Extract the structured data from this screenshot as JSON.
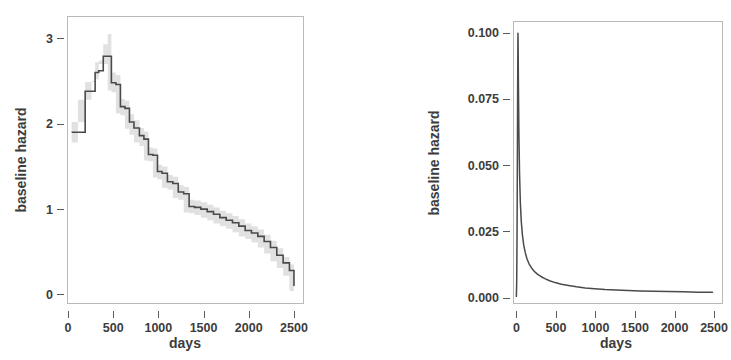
{
  "figure": {
    "background": "#ffffff",
    "line_color": "#4a4a4a",
    "band_color": "#cfcfcf",
    "frame_color": "#b9b9b9",
    "panel_count": 2
  },
  "chart_data": [
    {
      "id": "left-panel",
      "type": "line",
      "subtype": "step",
      "title": "",
      "xlabel": "days",
      "ylabel": "baseline hazard",
      "xlim": [
        0,
        2600
      ],
      "ylim": [
        -0.1,
        3.25
      ],
      "xticks": [
        0,
        500,
        1000,
        1500,
        2000,
        2500
      ],
      "xticklabels": [
        "0",
        "500",
        "1000",
        "1500",
        "2000",
        "2500"
      ],
      "yticks": [
        0,
        1,
        2,
        3
      ],
      "yticklabels": [
        "0",
        "1",
        "2",
        "3"
      ],
      "grid": false,
      "legend": "none",
      "has_confidence_band": true,
      "series": [
        {
          "name": "baseline hazard (step estimate)",
          "x": [
            40,
            110,
            190,
            260,
            300,
            340,
            390,
            440,
            480,
            530,
            580,
            630,
            680,
            730,
            790,
            840,
            890,
            940,
            990,
            1040,
            1100,
            1160,
            1220,
            1280,
            1340,
            1400,
            1470,
            1540,
            1610,
            1680,
            1750,
            1820,
            1890,
            1960,
            2030,
            2100,
            2170,
            2240,
            2310,
            2380,
            2450,
            2500
          ],
          "values": [
            1.9,
            1.9,
            2.38,
            2.38,
            2.6,
            2.62,
            2.79,
            2.79,
            2.48,
            2.46,
            2.2,
            2.18,
            2.02,
            1.95,
            1.86,
            1.82,
            1.64,
            1.63,
            1.44,
            1.42,
            1.32,
            1.3,
            1.2,
            1.18,
            1.03,
            1.02,
            1.0,
            0.97,
            0.94,
            0.9,
            0.87,
            0.84,
            0.8,
            0.75,
            0.72,
            0.68,
            0.62,
            0.55,
            0.46,
            0.37,
            0.28,
            0.1
          ],
          "band_lower": [
            1.78,
            1.78,
            2.28,
            2.28,
            2.5,
            2.52,
            2.7,
            2.7,
            2.39,
            2.37,
            2.12,
            2.1,
            1.94,
            1.87,
            1.78,
            1.74,
            1.57,
            1.56,
            1.37,
            1.35,
            1.25,
            1.23,
            1.13,
            1.11,
            0.96,
            0.95,
            0.93,
            0.9,
            0.87,
            0.83,
            0.8,
            0.77,
            0.73,
            0.68,
            0.65,
            0.61,
            0.55,
            0.48,
            0.39,
            0.31,
            0.22,
            0.04
          ],
          "band_upper": [
            2.02,
            2.02,
            2.49,
            2.49,
            2.72,
            2.74,
            2.93,
            3.05,
            2.6,
            2.57,
            2.29,
            2.27,
            2.11,
            2.04,
            1.95,
            1.91,
            1.72,
            1.71,
            1.52,
            1.5,
            1.4,
            1.38,
            1.28,
            1.26,
            1.11,
            1.1,
            1.08,
            1.05,
            1.02,
            0.98,
            0.95,
            0.92,
            0.88,
            0.83,
            0.8,
            0.76,
            0.7,
            0.63,
            0.54,
            0.44,
            0.35,
            0.17
          ]
        }
      ]
    },
    {
      "id": "right-panel",
      "type": "line",
      "subtype": "smooth",
      "title": "",
      "xlabel": "days",
      "ylabel": "baseline hazard",
      "xlim": [
        -30,
        2600
      ],
      "ylim": [
        -0.002,
        0.104
      ],
      "xticks": [
        0,
        500,
        1000,
        1500,
        2000,
        2500
      ],
      "xticklabels": [
        "0",
        "500",
        "1000",
        "1500",
        "2000",
        "2500"
      ],
      "yticks": [
        0.0,
        0.025,
        0.05,
        0.075,
        0.1
      ],
      "yticklabels": [
        "0.000",
        "0.025",
        "0.050",
        "0.075",
        "0.100"
      ],
      "grid": false,
      "legend": "none",
      "has_confidence_band": false,
      "series": [
        {
          "name": "baseline hazard (parametric)",
          "x": [
            0,
            4,
            8,
            12,
            16,
            20,
            22,
            26,
            32,
            40,
            50,
            62,
            76,
            92,
            112,
            135,
            160,
            190,
            225,
            265,
            310,
            360,
            420,
            490,
            570,
            660,
            760,
            870,
            990,
            1120,
            1260,
            1410,
            1570,
            1740,
            1920,
            2110,
            2300,
            2480
          ],
          "values": [
            0.0005,
            0.0055,
            0.0215,
            0.0475,
            0.079,
            0.0998,
            0.096,
            0.08,
            0.062,
            0.047,
            0.036,
            0.0288,
            0.0238,
            0.02,
            0.017,
            0.0146,
            0.0128,
            0.0113,
            0.01,
            0.0089,
            0.008,
            0.0072,
            0.0064,
            0.0057,
            0.0051,
            0.0046,
            0.0041,
            0.0037,
            0.0034,
            0.0031,
            0.0029,
            0.0027,
            0.0025,
            0.0024,
            0.0023,
            0.0022,
            0.0021,
            0.0021
          ]
        }
      ]
    }
  ]
}
